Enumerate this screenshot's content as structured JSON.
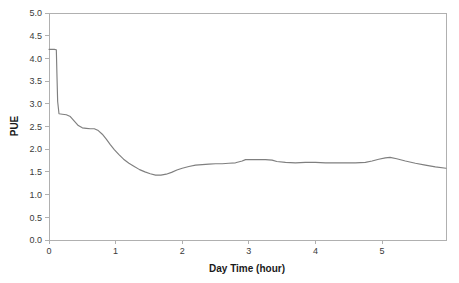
{
  "chart_data": {
    "type": "line",
    "title": "",
    "xlabel": "Day Time (hour)",
    "ylabel": "PUE",
    "xlim": [
      0,
      5.96
    ],
    "ylim": [
      0,
      5.0
    ],
    "grid": false,
    "legend": null,
    "line_color": "#7f7f7f",
    "axis_color": "#b0b0b0",
    "background": "#ffffff",
    "x_ticks": [
      0,
      1,
      2,
      3,
      4,
      5
    ],
    "x_tick_labels": [
      "0",
      "1",
      "2",
      "3",
      "4",
      "5"
    ],
    "y_ticks": [
      0.0,
      0.5,
      1.0,
      1.5,
      2.0,
      2.5,
      3.0,
      3.5,
      4.0,
      4.5,
      5.0
    ],
    "y_tick_labels": [
      "0.0",
      "0.5",
      "1.0",
      "1.5",
      "2.0",
      "2.5",
      "3.0",
      "3.5",
      "4.0",
      "4.5",
      "5.0"
    ],
    "series": [
      {
        "name": "PUE",
        "color": "#7f7f7f",
        "x": [
          0.0,
          0.04,
          0.08,
          0.11,
          0.12,
          0.13,
          0.15,
          0.2,
          0.26,
          0.32,
          0.38,
          0.44,
          0.5,
          0.56,
          0.62,
          0.68,
          0.74,
          0.8,
          0.86,
          0.92,
          0.98,
          1.05,
          1.12,
          1.2,
          1.28,
          1.36,
          1.44,
          1.52,
          1.6,
          1.68,
          1.76,
          1.84,
          1.92,
          2.0,
          2.1,
          2.2,
          2.3,
          2.4,
          2.5,
          2.6,
          2.7,
          2.8,
          2.9,
          2.95,
          3.05,
          3.15,
          3.25,
          3.35,
          3.42,
          3.55,
          3.7,
          3.85,
          4.0,
          4.15,
          4.3,
          4.45,
          4.6,
          4.75,
          4.85,
          4.95,
          5.05,
          5.12,
          5.22,
          5.35,
          5.5,
          5.65,
          5.8,
          5.96
        ],
        "y": [
          4.2,
          4.2,
          4.2,
          4.19,
          3.6,
          3.05,
          2.78,
          2.77,
          2.76,
          2.72,
          2.62,
          2.52,
          2.47,
          2.46,
          2.45,
          2.45,
          2.41,
          2.33,
          2.22,
          2.1,
          1.99,
          1.88,
          1.78,
          1.69,
          1.62,
          1.55,
          1.5,
          1.46,
          1.43,
          1.43,
          1.45,
          1.49,
          1.54,
          1.58,
          1.62,
          1.65,
          1.66,
          1.67,
          1.68,
          1.68,
          1.69,
          1.7,
          1.74,
          1.77,
          1.77,
          1.77,
          1.77,
          1.76,
          1.73,
          1.71,
          1.7,
          1.71,
          1.71,
          1.7,
          1.7,
          1.7,
          1.7,
          1.71,
          1.74,
          1.78,
          1.81,
          1.82,
          1.79,
          1.74,
          1.69,
          1.65,
          1.61,
          1.58
        ]
      }
    ]
  },
  "geometry": {
    "plot_left": 49,
    "plot_right": 446,
    "plot_top": 13,
    "plot_bottom": 240
  }
}
